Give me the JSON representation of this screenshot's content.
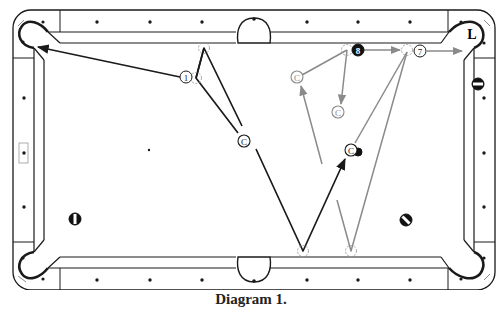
{
  "caption": "Diagram 1.",
  "colors": {
    "line": "#1a1a1a",
    "secondary_path": "#8a8a8a",
    "ghost": "#9a9a9a",
    "background": "#ffffff"
  },
  "table": {
    "diamonds_top": [
      [
        97,
        22
      ],
      [
        150,
        22
      ],
      [
        202,
        22
      ],
      [
        307,
        22
      ],
      [
        358,
        22
      ],
      [
        410,
        22
      ]
    ],
    "diamonds_bottom": [
      [
        97,
        280
      ],
      [
        150,
        280
      ],
      [
        202,
        280
      ],
      [
        307,
        280
      ],
      [
        358,
        280
      ],
      [
        410,
        280
      ]
    ],
    "diamonds_left": [
      [
        24,
        98
      ],
      [
        24,
        153
      ],
      [
        24,
        207
      ]
    ],
    "diamonds_right": [
      [
        484,
        98
      ],
      [
        484,
        153
      ],
      [
        484,
        207
      ]
    ],
    "spot": [
      149,
      150
    ],
    "left_marker": [
      24,
      153
    ]
  },
  "pockets": [
    {
      "name": "top-left",
      "label": ""
    },
    {
      "name": "top-side",
      "label": ""
    },
    {
      "name": "top-right",
      "label": "L"
    },
    {
      "name": "bottom-left",
      "label": ""
    },
    {
      "name": "bottom-side",
      "label": ""
    },
    {
      "name": "bottom-right",
      "label": ""
    }
  ],
  "balls": [
    {
      "id": "ball-1",
      "label": "1",
      "x": 186,
      "y": 77,
      "style": "plain"
    },
    {
      "id": "ball-8",
      "label": "8",
      "x": 358,
      "y": 50,
      "style": "solid-black"
    },
    {
      "id": "ball-7",
      "label": "7",
      "x": 420,
      "y": 51,
      "style": "plain"
    },
    {
      "id": "stripe-left",
      "label": "",
      "x": 75,
      "y": 219,
      "style": "stripe-vertical"
    },
    {
      "id": "stripe-right",
      "label": "",
      "x": 406,
      "y": 220,
      "style": "stripe-diagonal"
    },
    {
      "id": "stripe-right-top",
      "label": "",
      "x": 478,
      "y": 84,
      "style": "stripe-horizontal"
    },
    {
      "id": "blocker-ball",
      "label": "",
      "x": 358,
      "y": 152,
      "style": "solid-black-small"
    }
  ],
  "cue_balls": [
    {
      "id": "cue-black-1",
      "label": "C",
      "x": 244,
      "y": 141,
      "style": "dark"
    },
    {
      "id": "cue-black-2",
      "label": "C",
      "x": 351,
      "y": 150,
      "style": "dark"
    },
    {
      "id": "cue-grey-1",
      "label": "C",
      "x": 297,
      "y": 77,
      "style": "grey"
    },
    {
      "id": "cue-grey-2",
      "label": "C",
      "x": 338,
      "y": 112,
      "style": "grey"
    }
  ],
  "ghost_balls": [
    {
      "x": 204,
      "y": 48
    },
    {
      "x": 196,
      "y": 78
    },
    {
      "x": 347,
      "y": 50
    },
    {
      "x": 407,
      "y": 50
    },
    {
      "x": 303,
      "y": 251
    },
    {
      "x": 351,
      "y": 251
    }
  ],
  "paths_black": [
    {
      "points": [
        [
          180,
          77
        ],
        [
          38,
          47
        ]
      ],
      "arrow": true
    },
    {
      "points": [
        [
          196,
          78
        ],
        [
          204,
          48
        ],
        [
          242,
          126
        ]
      ],
      "arrow": false
    },
    {
      "points": [
        [
          204,
          48
        ],
        [
          196,
          78
        ],
        [
          238,
          133
        ]
      ],
      "arrow": false
    },
    {
      "points": [
        [
          256,
          149
        ],
        [
          303,
          251
        ],
        [
          345,
          159
        ]
      ],
      "arrow": true
    }
  ],
  "paths_grey": [
    {
      "points": [
        [
          347,
          50
        ],
        [
          302,
          75
        ]
      ],
      "arrow": false
    },
    {
      "points": [
        [
          347,
          50
        ],
        [
          341,
          104
        ]
      ],
      "arrow": true
    },
    {
      "points": [
        [
          364,
          50
        ],
        [
          400,
          50
        ]
      ],
      "arrow": true
    },
    {
      "points": [
        [
          427,
          51
        ],
        [
          462,
          51
        ]
      ],
      "arrow": true
    },
    {
      "points": [
        [
          322,
          164
        ],
        [
          301,
          86
        ]
      ],
      "arrow": true
    },
    {
      "points": [
        [
          337,
          200
        ],
        [
          351,
          251
        ],
        [
          407,
          52
        ]
      ],
      "arrow": false
    },
    {
      "points": [
        [
          407,
          52
        ],
        [
          355,
          143
        ]
      ],
      "arrow": false
    }
  ]
}
